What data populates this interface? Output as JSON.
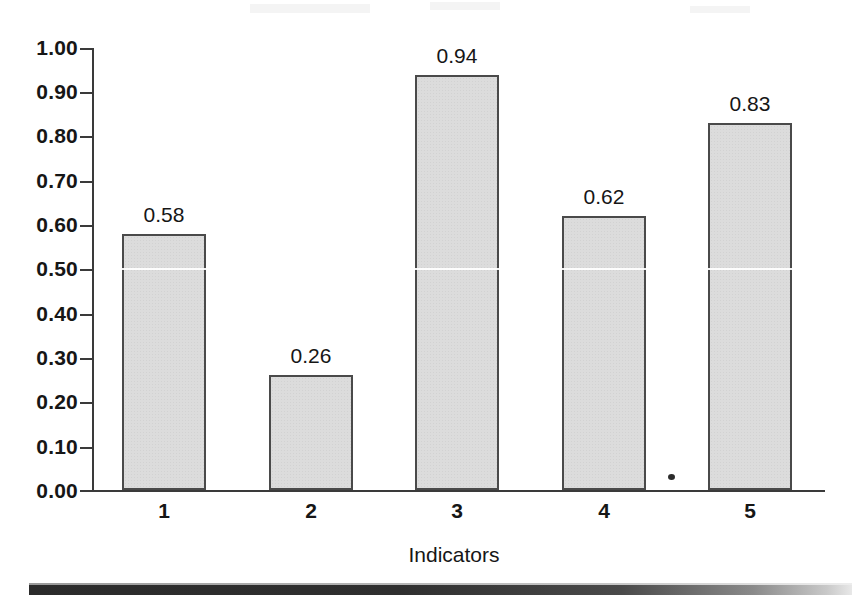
{
  "chart_data": {
    "type": "bar",
    "title": "",
    "xlabel": "Indicators",
    "ylabel": "",
    "categories": [
      "1",
      "2",
      "3",
      "4",
      "5"
    ],
    "values": [
      0.58,
      0.26,
      0.94,
      0.62,
      0.83
    ],
    "value_labels": [
      "0.58",
      "0.26",
      "0.94",
      "0.62",
      "0.83"
    ],
    "ylim": [
      0.0,
      1.0
    ],
    "ytick_labels": [
      "1.00",
      "0.90",
      "0.80",
      "0.70",
      "0.60",
      "0.50",
      "0.40",
      "0.30",
      "0.20",
      "0.10",
      "0.00"
    ],
    "ytick_values": [
      1.0,
      0.9,
      0.8,
      0.7,
      0.6,
      0.5,
      0.4,
      0.3,
      0.2,
      0.1,
      0.0
    ],
    "grid": "single white gridline at 0.50",
    "legend": "none",
    "bar_fill_color": "#dcdcdc",
    "bar_edge_color": "#4a4a4a",
    "axis_color": "#3a3a3a",
    "text_color": "#161616",
    "background_color": "#ffffff"
  },
  "axis": {
    "x_title": "Indicators"
  }
}
